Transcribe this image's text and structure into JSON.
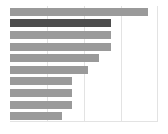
{
  "chart_data": {
    "type": "bar",
    "orientation": "horizontal",
    "title": "",
    "subtitle": "",
    "xlabel": "",
    "ylabel": "",
    "grid": true,
    "gridline_axis": "x",
    "legend": false,
    "xlim": [
      0,
      100
    ],
    "xticks": [
      0,
      25,
      50,
      75,
      100
    ],
    "xtick_labels": [
      "",
      "",
      "",
      "",
      ""
    ],
    "categories": [
      "1",
      "2",
      "3",
      "4",
      "5",
      "6",
      "7",
      "8",
      "9",
      "10"
    ],
    "ytick_labels": [
      "",
      "",
      "",
      "",
      "",
      "",
      "",
      "",
      "",
      ""
    ],
    "values": [
      93,
      68,
      68,
      68,
      60,
      53,
      42,
      42,
      42,
      35
    ],
    "series": [
      {
        "name": "series-1",
        "values": [
          93,
          68,
          68,
          68,
          60,
          53,
          42,
          42,
          42,
          35
        ]
      }
    ],
    "highlight_index": 1,
    "colors": {
      "bar": "#9a9a9a",
      "bar_highlight": "#4d4d4d",
      "gridline": "#e3e3e3",
      "background": "#ffffff"
    }
  }
}
